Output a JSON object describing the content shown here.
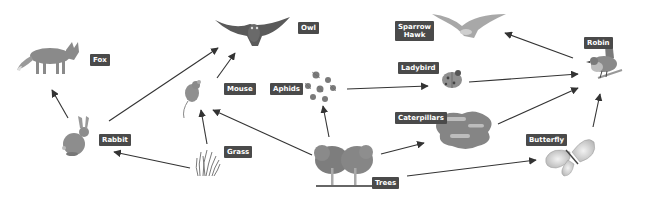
{
  "diagram": {
    "type": "food-web",
    "colors": {
      "label_bg": "#4a4a4a",
      "label_text": "#ffffff",
      "arrow": "#333333",
      "background": "#ffffff"
    },
    "organisms": [
      {
        "id": "fox",
        "label": "Fox"
      },
      {
        "id": "owl",
        "label": "Owl"
      },
      {
        "id": "sparrowhawk",
        "label": "Sparrow\nHawk"
      },
      {
        "id": "robin",
        "label": "Robin"
      },
      {
        "id": "mouse",
        "label": "Mouse"
      },
      {
        "id": "aphids",
        "label": "Aphids"
      },
      {
        "id": "ladybird",
        "label": "Ladybird"
      },
      {
        "id": "rabbit",
        "label": "Rabbit"
      },
      {
        "id": "grass",
        "label": "Grass"
      },
      {
        "id": "caterpillars",
        "label": "Caterpillars"
      },
      {
        "id": "butterfly",
        "label": "Butterfly"
      },
      {
        "id": "trees",
        "label": "Trees"
      }
    ],
    "edges": [
      {
        "from": "Rabbit",
        "to": "Fox"
      },
      {
        "from": "Rabbit",
        "to": "Owl"
      },
      {
        "from": "Mouse",
        "to": "Owl"
      },
      {
        "from": "Grass",
        "to": "Rabbit"
      },
      {
        "from": "Grass",
        "to": "Mouse"
      },
      {
        "from": "Trees",
        "to": "Mouse"
      },
      {
        "from": "Trees",
        "to": "Aphids"
      },
      {
        "from": "Trees",
        "to": "Caterpillars"
      },
      {
        "from": "Trees",
        "to": "Butterfly"
      },
      {
        "from": "Aphids",
        "to": "Ladybird"
      },
      {
        "from": "Ladybird",
        "to": "Robin"
      },
      {
        "from": "Caterpillars",
        "to": "Robin"
      },
      {
        "from": "Butterfly",
        "to": "Robin"
      },
      {
        "from": "Robin",
        "to": "Sparrow Hawk"
      }
    ]
  }
}
